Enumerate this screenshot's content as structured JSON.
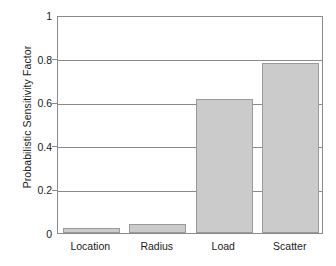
{
  "chart_data": {
    "type": "bar",
    "title": "",
    "xlabel": "",
    "ylabel": "Probabilistic Sensitivity Factor",
    "categories": [
      "Location",
      "Radius",
      "Load",
      "Scatter"
    ],
    "values": [
      0.025,
      0.042,
      0.615,
      0.78
    ],
    "ylim": [
      0,
      1
    ],
    "yticks": [
      0,
      0.2,
      0.4,
      0.6,
      0.8,
      1
    ],
    "ytick_labels": [
      "0",
      "0.2",
      "0.4",
      "0.6",
      "0.8",
      "1"
    ],
    "grid": true,
    "legend": null,
    "bar_color": "#cbcbcb",
    "bar_edge_color": "#9a9a9a",
    "axis_color": "#8a8a8a",
    "background": "#ffffff"
  }
}
